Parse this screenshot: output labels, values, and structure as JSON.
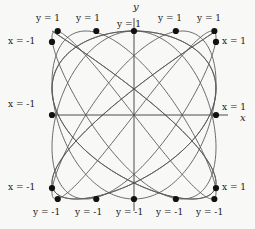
{
  "figure": {
    "title": "",
    "background_color": "#f8f8f6",
    "curve_color": "#5a5a5a",
    "axis_color": "#4d4d4d",
    "dot_color": "#111111"
  },
  "axes": {
    "x_axis_label": "x",
    "y_axis_label": "y",
    "xlim": [
      -1,
      1
    ],
    "ylim": [
      -1,
      1
    ]
  },
  "labels": {
    "top": [
      {
        "text": "y = 1",
        "x": 36,
        "y": 13
      },
      {
        "text": "y = 1",
        "x": 76,
        "y": 13
      },
      {
        "text": "y = 1",
        "x": 117,
        "y": 19
      },
      {
        "text": "y = 1",
        "x": 158,
        "y": 13
      },
      {
        "text": "y = 1",
        "x": 197,
        "y": 13
      }
    ],
    "bottom": [
      {
        "text": "y = -1",
        "x": 33,
        "y": 207
      },
      {
        "text": "y = -1",
        "x": 75,
        "y": 207
      },
      {
        "text": "y = -1",
        "x": 116,
        "y": 207
      },
      {
        "text": "y = -1",
        "x": 156,
        "y": 207
      },
      {
        "text": "y = -1",
        "x": 196,
        "y": 207
      }
    ],
    "left": [
      {
        "text": "x = -1",
        "x": 8,
        "y": 36
      },
      {
        "text": "x = -1",
        "x": 8,
        "y": 99
      },
      {
        "text": "x = -1",
        "x": 8,
        "y": 182
      }
    ],
    "right": [
      {
        "text": "x = 1",
        "x": 222,
        "y": 36
      },
      {
        "text": "x = 1",
        "x": 222,
        "y": 102
      },
      {
        "text": "x = 1",
        "x": 222,
        "y": 182
      }
    ]
  },
  "chart_data": {
    "type": "line",
    "title": "",
    "xlabel": "x",
    "ylabel": "y",
    "xlim": [
      -1,
      1
    ],
    "ylim": [
      -1,
      1
    ],
    "grid": false,
    "series": [
      {
        "name": "curve-1",
        "kind": "lissajous",
        "a": 4,
        "b": 5,
        "phase": 0
      },
      {
        "name": "curve-2",
        "kind": "lissajous",
        "a": 5,
        "b": 4,
        "phase": 0
      }
    ],
    "tangency_points": [
      {
        "label": "y = 1",
        "x": -0.93,
        "y": 1.0
      },
      {
        "label": "y = 1",
        "x": -0.46,
        "y": 1.0
      },
      {
        "label": "y = 1",
        "x": 0.0,
        "y": 1.0
      },
      {
        "label": "y = 1",
        "x": 0.51,
        "y": 1.0
      },
      {
        "label": "y = 1",
        "x": 0.98,
        "y": 1.0
      },
      {
        "label": "y = -1",
        "x": -0.93,
        "y": -1.0
      },
      {
        "label": "y = -1",
        "x": -0.46,
        "y": -1.0
      },
      {
        "label": "y = -1",
        "x": 0.0,
        "y": -1.0
      },
      {
        "label": "y = -1",
        "x": 0.51,
        "y": -1.0
      },
      {
        "label": "y = -1",
        "x": 0.98,
        "y": -1.0
      },
      {
        "label": "x = -1",
        "x": -1.0,
        "y": 0.87
      },
      {
        "label": "x = -1",
        "x": -1.0,
        "y": 0.0
      },
      {
        "label": "x = -1",
        "x": -1.0,
        "y": -0.87
      },
      {
        "label": "x = 1",
        "x": 1.0,
        "y": 0.87
      },
      {
        "label": "x = 1",
        "x": 1.0,
        "y": 0.0
      },
      {
        "label": "x = 1",
        "x": 1.0,
        "y": -0.87
      }
    ]
  }
}
